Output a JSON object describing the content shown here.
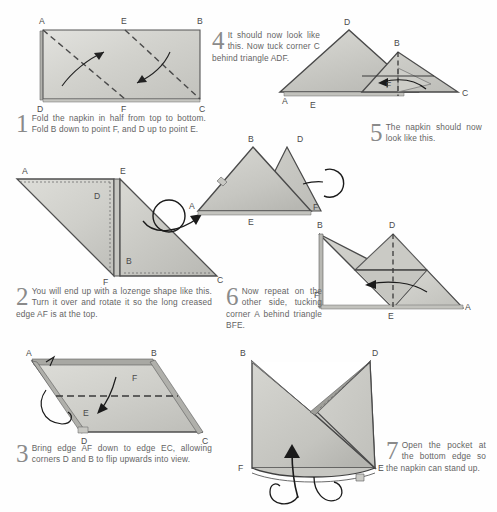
{
  "document": {
    "title": "Napkin folding instructions",
    "steps": [
      {
        "number": "1",
        "text": "Fold the napkin in half from top to bottom. Fold B down to point F, and D up to point E.",
        "diagram_labels": [
          "A",
          "E",
          "B",
          "D",
          "F",
          "C"
        ]
      },
      {
        "number": "2",
        "text": "You will end up with a lozenge shape like this. Turn it over and rotate it so the long creased edge AF is at the top.",
        "diagram_labels": [
          "A",
          "E",
          "D",
          "B",
          "F",
          "C"
        ]
      },
      {
        "number": "3",
        "text": "Bring edge AF down to edge EC, allowing corners D and B to flip upwards into view.",
        "diagram_labels": [
          "A",
          "B",
          "F",
          "E",
          "D",
          "C"
        ]
      },
      {
        "number": "4",
        "text": "It should now look like this. Now tuck corner C behind triangle ADF.",
        "diagram_labels": [
          "B",
          "D",
          "A",
          "E",
          "F"
        ]
      },
      {
        "number": "5",
        "text": "The napkin should now look like this.",
        "diagram_labels": [
          "D",
          "B",
          "A",
          "E",
          "F",
          "C"
        ]
      },
      {
        "number": "6",
        "text": "Now repeat on the other side, tucking corner A behind triangle BFE.",
        "diagram_labels": [
          "B",
          "D",
          "F",
          "E",
          "A"
        ]
      },
      {
        "number": "7",
        "text": "Open the pocket at the bottom edge so the napkin can stand up.",
        "diagram_labels": [
          "B",
          "D",
          "F",
          "E"
        ]
      }
    ]
  },
  "labels": {
    "A": "A",
    "B": "B",
    "C": "C",
    "D": "D",
    "E": "E",
    "F": "F"
  },
  "colors": {
    "paper_light": "#dcdcd8",
    "paper_mid": "#c9c9c4",
    "paper_dark": "#b4b4af",
    "outline": "#4d4d4d",
    "text": "#646464",
    "number": "#8a8a8a",
    "background": "#fefefe"
  }
}
